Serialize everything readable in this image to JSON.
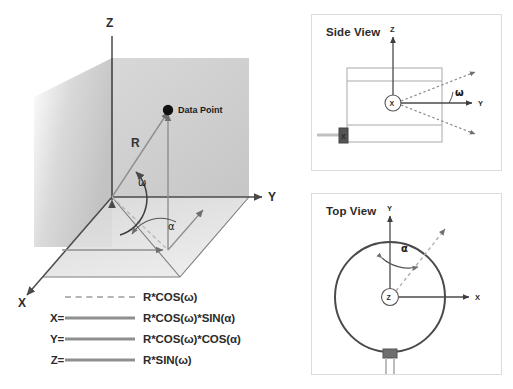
{
  "diagram": {
    "main": {
      "axes": {
        "x": "X",
        "y": "Y",
        "z": "Z"
      },
      "radius_label": "R",
      "point_label": "Data Point",
      "angles": {
        "elevation": "ω",
        "azimuth": "α"
      }
    },
    "legend": {
      "rows": [
        {
          "key": "",
          "style": "dashed",
          "formula": "R*COS(ω)"
        },
        {
          "key": "X=",
          "style": "solid",
          "formula": "R*COS(ω)*SIN(α)"
        },
        {
          "key": "Y=",
          "style": "solid",
          "formula": "R*COS(ω)*COS(α)"
        },
        {
          "key": "Z=",
          "style": "solid",
          "formula": "R*SIN(ω)"
        }
      ]
    },
    "side_view": {
      "title": "Side View",
      "axis_vertical": "Z",
      "axis_horizontal": "Y",
      "origin_marker": "X",
      "device_marker": "X",
      "angle": "ω"
    },
    "top_view": {
      "title": "Top View",
      "axis_vertical": "Y",
      "axis_horizontal": "X",
      "origin_marker": "Z",
      "angle": "α"
    }
  },
  "colors": {
    "ink": "#2b2b2b",
    "line_gray": "#8f8f8f",
    "dash_gray": "#b4b4b4",
    "plane_gray": "#c8c8c8",
    "panel_border": "#dcdcdc"
  }
}
